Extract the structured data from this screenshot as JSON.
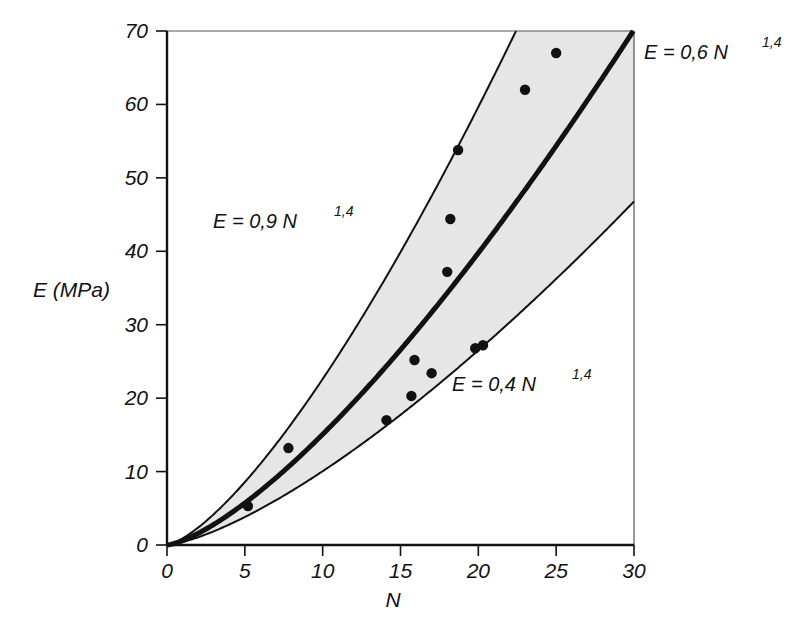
{
  "chart_data": {
    "type": "scatter",
    "title": "",
    "subtitle": "",
    "xlabel": "N",
    "ylabel": "E (MPa)",
    "xlim": [
      0,
      30
    ],
    "ylim": [
      0,
      70
    ],
    "xticks": [
      "0",
      "5",
      "10",
      "15",
      "20",
      "25",
      "30"
    ],
    "xtick_values": [
      0,
      5,
      10,
      15,
      20,
      25,
      30
    ],
    "yticks": [
      "0",
      "10",
      "20",
      "30",
      "40",
      "50",
      "60",
      "70"
    ],
    "ytick_values": [
      0,
      10,
      20,
      30,
      40,
      50,
      60,
      70
    ],
    "grid": false,
    "legend_position": "none",
    "points_label": "measured data points",
    "points": [
      {
        "x": 5.2,
        "y": 5.3
      },
      {
        "x": 7.8,
        "y": 13.2
      },
      {
        "x": 14.1,
        "y": 17.0
      },
      {
        "x": 15.7,
        "y": 20.3
      },
      {
        "x": 15.9,
        "y": 25.2
      },
      {
        "x": 17.0,
        "y": 23.4
      },
      {
        "x": 19.8,
        "y": 26.8
      },
      {
        "x": 20.3,
        "y": 27.2
      },
      {
        "x": 18.0,
        "y": 37.2
      },
      {
        "x": 18.2,
        "y": 44.4
      },
      {
        "x": 18.7,
        "y": 53.8
      },
      {
        "x": 23.0,
        "y": 62.0
      },
      {
        "x": 25.0,
        "y": 67.0
      }
    ],
    "series": [
      {
        "name": "upper-bound-curve",
        "equation_label": "E = 0,9 N",
        "equation_exponent": "1,4",
        "coefficient": 0.9,
        "exponent": 1.4,
        "style": "thin",
        "color": "#111111"
      },
      {
        "name": "central-curve",
        "equation_label": "E = 0,6 N",
        "equation_exponent": "1,4",
        "coefficient": 0.6,
        "exponent": 1.4,
        "style": "thick",
        "color": "#111111"
      },
      {
        "name": "lower-bound-curve",
        "equation_label": "E = 0,4 N",
        "equation_exponent": "1,4",
        "coefficient": 0.4,
        "exponent": 1.4,
        "style": "thin",
        "color": "#111111"
      }
    ],
    "shaded_band": {
      "name": "scatter-band",
      "between": [
        "lower-bound-curve",
        "upper-bound-curve"
      ],
      "fill": "#e6e6e6"
    },
    "annotations": [
      {
        "name": "label-upper-curve",
        "text": "E = 0,9 N",
        "exponent": "1,4",
        "x_px": 300,
        "y_px": 228
      },
      {
        "name": "label-central-curve",
        "text": "E = 0,6 N",
        "exponent": "1,4",
        "x_px": 644,
        "y_px": 59
      },
      {
        "name": "label-lower-curve",
        "text": "E = 0,4 N",
        "exponent": "1,4",
        "x_px": 452,
        "y_px": 391
      }
    ],
    "colors": {
      "axis": "#111111",
      "band_fill": "#e6e6e6",
      "point": "#111111",
      "background": "#ffffff"
    }
  }
}
